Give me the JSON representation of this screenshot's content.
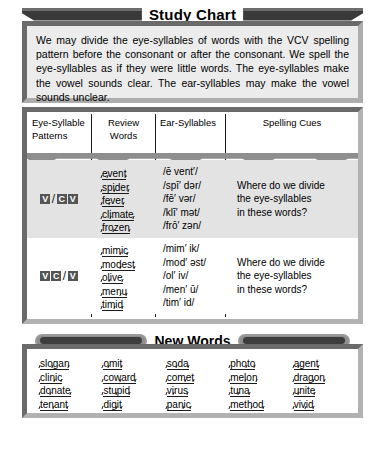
{
  "chart": {
    "title": "Study Chart",
    "intro": "We may divide the eye-syllables of words with the VCV spelling pattern before the consonant or after the consonant. We spell the eye-syllables as if they were little words. The eye-syllables make the vowel sounds clear. The ear-syllables may make the vowel sounds unclear."
  },
  "table": {
    "headers": [
      "Eye-Syllable Patterns",
      "Review Words",
      "Ear-Syllables",
      "Spelling Cues"
    ],
    "header_lines": [
      [
        "Eye-Syllable",
        "Patterns"
      ],
      [
        "Review",
        "Words"
      ],
      [
        "Ear-Syllables"
      ],
      [
        "Spelling Cues"
      ]
    ],
    "rows": [
      {
        "pattern": "V/CV",
        "pattern_tokens": [
          "V",
          "/",
          "C",
          "V"
        ],
        "words": [
          {
            "syllables": [
              "e",
              "vent"
            ]
          },
          {
            "syllables": [
              "spi",
              "der"
            ]
          },
          {
            "syllables": [
              "fe",
              "ver"
            ]
          },
          {
            "syllables": [
              "cli",
              "mate"
            ]
          },
          {
            "syllables": [
              "fro",
              "zen"
            ]
          }
        ],
        "ear_syllables": [
          "/ē vent′/",
          "/spī′ dər/",
          "/fē′ vər/",
          "/klī′ mət/",
          "/frō′ zən/"
        ],
        "cue_lines": [
          "Where do we divide",
          "the eye-syllables",
          "in these words?"
        ]
      },
      {
        "pattern": "VC/V",
        "pattern_tokens": [
          "V",
          "C",
          "/",
          "V"
        ],
        "words": [
          {
            "syllables": [
              "mim",
              "ic"
            ]
          },
          {
            "syllables": [
              "mod",
              "est"
            ]
          },
          {
            "syllables": [
              "ol",
              "ive"
            ]
          },
          {
            "syllables": [
              "men",
              "u"
            ]
          },
          {
            "syllables": [
              "tim",
              "id"
            ]
          }
        ],
        "ear_syllables": [
          "/mim′ ik/",
          "/mod′ əst/",
          "/ol′ iv/",
          "/men′ ū/",
          "/tim′ id/"
        ],
        "cue_lines": [
          "Where do we divide",
          "the eye-syllables",
          "in these words?"
        ]
      }
    ]
  },
  "new_words": {
    "title": "New Words",
    "columns": [
      [
        {
          "syllables": [
            "slo",
            "gan"
          ]
        },
        {
          "syllables": [
            "clin",
            "ic"
          ]
        },
        {
          "syllables": [
            "do",
            "nate"
          ]
        },
        {
          "syllables": [
            "ten",
            "ant"
          ]
        }
      ],
      [
        {
          "syllables": [
            "o",
            "mit"
          ]
        },
        {
          "syllables": [
            "cow",
            "ard"
          ]
        },
        {
          "syllables": [
            "stu",
            "pid"
          ]
        },
        {
          "syllables": [
            "dig",
            "it"
          ]
        }
      ],
      [
        {
          "syllables": [
            "so",
            "da"
          ]
        },
        {
          "syllables": [
            "com",
            "et"
          ]
        },
        {
          "syllables": [
            "vi",
            "rus"
          ]
        },
        {
          "syllables": [
            "pan",
            "ic"
          ]
        }
      ],
      [
        {
          "syllables": [
            "pho",
            "to"
          ]
        },
        {
          "syllables": [
            "mel",
            "on"
          ]
        },
        {
          "syllables": [
            "tu",
            "na"
          ]
        },
        {
          "syllables": [
            "meth",
            "od"
          ]
        }
      ],
      [
        {
          "syllables": [
            "a",
            "gent"
          ]
        },
        {
          "syllables": [
            "drag",
            "on"
          ]
        },
        {
          "syllables": [
            "u",
            "nite"
          ]
        },
        {
          "syllables": [
            "viv",
            "id"
          ]
        }
      ]
    ]
  },
  "colors": {
    "frame_gray": "#8e8e8e",
    "panel_tint": "#ececec",
    "row_tint": "#e3e3e3",
    "ink": "#1a1a1a",
    "badge_fill": "#545454",
    "badge_text": "#ffffff"
  }
}
